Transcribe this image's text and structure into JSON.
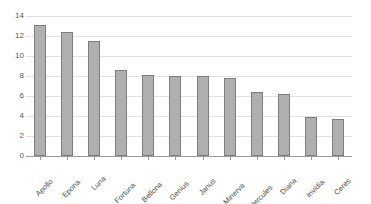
{
  "chart_data": {
    "type": "bar",
    "title": "",
    "subtitle": "",
    "xlabel": "",
    "ylabel": "",
    "ylim": [
      0,
      14
    ],
    "ytick_step": 2,
    "yticks": [
      0,
      2,
      4,
      6,
      8,
      10,
      12,
      14
    ],
    "ytick_labels": [
      "0",
      "2",
      "4",
      "6",
      "8",
      "10",
      "12",
      "14"
    ],
    "grid": "horizontal",
    "legend": "none",
    "categories": [
      "Apollo",
      "Epona",
      "Luna",
      "Fortuna",
      "Bellona",
      "Genius",
      "Janus",
      "Minerva",
      "Hercules",
      "Diana",
      "Invidia",
      "Ceres"
    ],
    "values": [
      13.1,
      12.4,
      11.5,
      8.6,
      8.1,
      8.05,
      8.0,
      7.8,
      6.4,
      6.2,
      3.9,
      3.7
    ],
    "bar_fill_color": "#b0b0b0",
    "bar_border_color": "#7d7d7d",
    "gridline_color": "#e2e2e2",
    "axis_color": "#9a9a9a",
    "tick_label_color": "#555555",
    "background_color": "#ffffff"
  }
}
